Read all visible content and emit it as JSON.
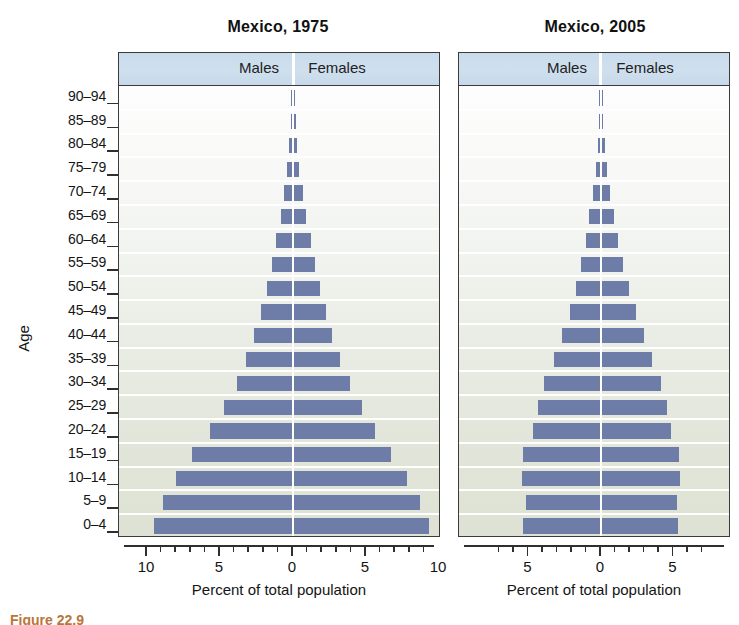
{
  "figure": {
    "caption_partial": "Figure 22.9",
    "y_axis_label": "Age",
    "x_axis_title": "Percent of total population",
    "series_labels": {
      "males": "Males",
      "females": "Females"
    },
    "age_groups": [
      "90–94",
      "85–89",
      "80–84",
      "75–79",
      "70–74",
      "65–69",
      "60–64",
      "55–59",
      "50–54",
      "45–49",
      "40–44",
      "35–39",
      "30–34",
      "25–29",
      "20–24",
      "15–19",
      "10–14",
      "5–9",
      "0–4"
    ],
    "colors": {
      "bar": "#6d7da7",
      "header_band": "#cbdced",
      "axis": "#2f2f2f",
      "panel_border": "#3b3b3b"
    }
  },
  "panels": [
    {
      "id": "p1975",
      "title": "Mexico, 1975"
    },
    {
      "id": "p2005",
      "title": "Mexico, 2005"
    }
  ],
  "chart_data": [
    {
      "type": "bar",
      "subtype": "population-pyramid",
      "title": "Mexico, 1975",
      "xlabel": "Percent of total population",
      "ylabel": "Age",
      "categories": [
        "90–94",
        "85–89",
        "80–84",
        "75–79",
        "70–74",
        "65–69",
        "60–64",
        "55–59",
        "50–54",
        "45–49",
        "40–44",
        "35–39",
        "30–34",
        "25–29",
        "20–24",
        "15–19",
        "10–14",
        "5–9",
        "0–4"
      ],
      "xlim": [
        -10,
        10
      ],
      "xticks": [
        10,
        9,
        8,
        7,
        6,
        5,
        4,
        3,
        2,
        1,
        0,
        1,
        2,
        3,
        4,
        5,
        6,
        7,
        8,
        9,
        10
      ],
      "xtick_labels_shown": [
        "10",
        "5",
        "0",
        "5",
        "10"
      ],
      "grid": false,
      "legend": [
        "Males",
        "Females"
      ],
      "legend_position": "top-band",
      "series": [
        {
          "name": "Males",
          "values": [
            0.08,
            0.15,
            0.25,
            0.4,
            0.6,
            0.85,
            1.15,
            1.45,
            1.8,
            2.2,
            2.65,
            3.2,
            3.85,
            4.7,
            5.7,
            6.9,
            8.0,
            8.9,
            9.5
          ]
        },
        {
          "name": "Females",
          "values": [
            0.09,
            0.17,
            0.28,
            0.44,
            0.65,
            0.9,
            1.2,
            1.5,
            1.85,
            2.25,
            2.7,
            3.25,
            3.9,
            4.7,
            5.6,
            6.7,
            7.8,
            8.7,
            9.3
          ]
        }
      ]
    },
    {
      "type": "bar",
      "subtype": "population-pyramid",
      "title": "Mexico, 2005",
      "xlabel": "Percent of total population",
      "ylabel": "Age",
      "categories": [
        "90–94",
        "85–89",
        "80–84",
        "75–79",
        "70–74",
        "65–69",
        "60–64",
        "55–59",
        "50–54",
        "45–49",
        "40–44",
        "35–39",
        "30–34",
        "25–29",
        "20–24",
        "15–19",
        "10–14",
        "5–9",
        "0–4"
      ],
      "xlim": [
        -7.2,
        7.2
      ],
      "xticks": [
        7,
        6,
        5,
        4,
        3,
        2,
        1,
        0,
        1,
        2,
        3,
        4,
        5,
        6,
        7
      ],
      "xtick_labels_shown": [
        "5",
        "0",
        "5"
      ],
      "grid": false,
      "legend": [
        "Males",
        "Females"
      ],
      "legend_position": "top-band",
      "series": [
        {
          "name": "Males",
          "values": [
            0.05,
            0.12,
            0.22,
            0.35,
            0.55,
            0.8,
            1.05,
            1.35,
            1.75,
            2.15,
            2.7,
            3.25,
            3.9,
            4.35,
            4.7,
            5.35,
            5.45,
            5.2,
            5.4
          ]
        },
        {
          "name": "Females",
          "values": [
            0.07,
            0.15,
            0.27,
            0.42,
            0.62,
            0.9,
            1.18,
            1.5,
            1.95,
            2.4,
            2.95,
            3.5,
            4.15,
            4.55,
            4.8,
            5.4,
            5.45,
            5.25,
            5.3
          ]
        }
      ]
    }
  ]
}
